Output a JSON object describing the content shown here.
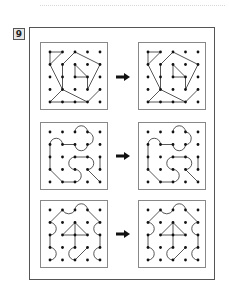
{
  "problem": {
    "number": "9"
  },
  "layout": {
    "rows": 3,
    "panel_grid": "5x5 dots",
    "arrow_direction": "right"
  },
  "colors": {
    "line": "#444444",
    "dot": "#111111",
    "frame": "#555555",
    "badge_bg": "#e8e8e8"
  },
  "rows": [
    {
      "label": "pattern-1",
      "left": "original",
      "right": "copy"
    },
    {
      "label": "pattern-2",
      "left": "original",
      "right": "copy"
    },
    {
      "label": "pattern-3",
      "left": "original",
      "right": "copy"
    }
  ]
}
